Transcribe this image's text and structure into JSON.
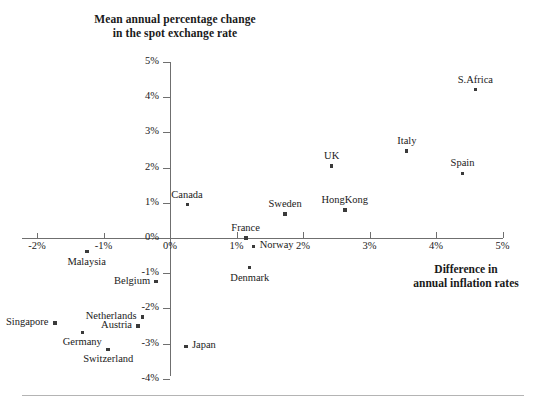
{
  "chart_data": {
    "type": "scatter",
    "title": "Mean annual percentage change in the spot exchange rate",
    "title_line1": "Mean annual percentage change",
    "title_line2": "in the spot exchange rate",
    "xlabel": "Difference in annual inflation rates",
    "xlabel_line1": "Difference in",
    "xlabel_line2": "annual inflation rates",
    "ylabel": "Mean annual percentage change in the spot exchange rate",
    "xlim": [
      -2,
      5
    ],
    "ylim": [
      -4,
      5
    ],
    "xticks": [
      "-2%",
      "-1%",
      "0%",
      "1%",
      "2%",
      "3%",
      "4%",
      "5%"
    ],
    "xtick_values": [
      -2,
      -1,
      0,
      1,
      2,
      3,
      4,
      5
    ],
    "yticks": [
      "5%",
      "4%",
      "3%",
      "2%",
      "1%",
      "0%",
      "-1%",
      "-2%",
      "-3%",
      "-4%"
    ],
    "ytick_values": [
      5,
      4,
      3,
      2,
      1,
      0,
      -1,
      -2,
      -3,
      -4
    ],
    "grid": false,
    "legend": false,
    "marker_color": "#3a3a3a",
    "axis_color": "#6f6f6f",
    "points": [
      {
        "label": "S.Africa",
        "x": 4.59,
        "y": 4.21,
        "lab_pos": "above"
      },
      {
        "label": "Italy",
        "x": 3.56,
        "y": 2.47,
        "lab_pos": "above"
      },
      {
        "label": "Spain",
        "x": 4.4,
        "y": 1.84,
        "lab_pos": "above"
      },
      {
        "label": "UK",
        "x": 2.43,
        "y": 2.05,
        "lab_pos": "above"
      },
      {
        "label": "HongKong",
        "x": 2.63,
        "y": 0.79,
        "lab_pos": "above"
      },
      {
        "label": "Sweden",
        "x": 1.73,
        "y": 0.68,
        "lab_pos": "above"
      },
      {
        "label": "Canada",
        "x": 0.26,
        "y": 0.95,
        "lab_pos": "above"
      },
      {
        "label": "France",
        "x": 1.14,
        "y": 0.0,
        "lab_pos": "above"
      },
      {
        "label": "Norway",
        "x": 1.26,
        "y": -0.24,
        "lab_pos": "right"
      },
      {
        "label": "Denmark",
        "x": 1.2,
        "y": -0.84,
        "lab_pos": "below"
      },
      {
        "label": "Malaysia",
        "x": -1.25,
        "y": -0.39,
        "lab_pos": "below"
      },
      {
        "label": "Belgium",
        "x": -0.21,
        "y": -1.24,
        "lab_pos": "left"
      },
      {
        "label": "Netherlands",
        "x": -0.41,
        "y": -2.24,
        "lab_pos": "left"
      },
      {
        "label": "Austria",
        "x": -0.48,
        "y": -2.5,
        "lab_pos": "left"
      },
      {
        "label": "Singapore",
        "x": -1.73,
        "y": -2.42,
        "lab_pos": "left"
      },
      {
        "label": "Germany",
        "x": -1.32,
        "y": -2.68,
        "lab_pos": "below"
      },
      {
        "label": "Switzerland",
        "x": -0.93,
        "y": -3.16,
        "lab_pos": "below"
      },
      {
        "label": "Japan",
        "x": 0.24,
        "y": -3.08,
        "lab_pos": "right"
      }
    ]
  }
}
